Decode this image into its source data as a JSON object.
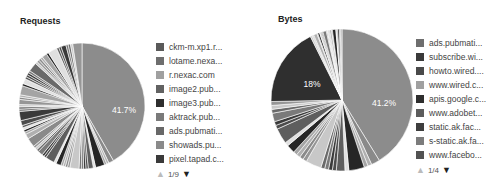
{
  "chart_data": [
    {
      "type": "pie",
      "title": "Requests",
      "legend_position": "right",
      "legend": [
        "ckm-m.xp1.r...",
        "lotame.nexa...",
        "r.nexac.com",
        "image2.pub...",
        "image3.pub...",
        "aktrack.pub...",
        "ads.pubmati...",
        "showads.pu...",
        "pixel.tapad.c..."
      ],
      "legend_colors": [
        "#5a5a5a",
        "#6e6e6e",
        "#a0a0a0",
        "#626262",
        "#2e2e2e",
        "#7a7a7a",
        "#686868",
        "#8a8a8a",
        "#3a3a3a"
      ],
      "slices": [
        {
          "label": "ckm-m.xp1.r...",
          "value": 41.7,
          "color": "#8c8c8c",
          "shown_label": "41.7%"
        },
        {
          "label": "other",
          "value": 58.3,
          "color": "#6a6a6a"
        }
      ],
      "pager": {
        "current": 1,
        "total": 9,
        "text": "1/9"
      }
    },
    {
      "type": "pie",
      "title": "Bytes",
      "legend_position": "right",
      "legend": [
        "ads.pubmati...",
        "subscribe.wi...",
        "howto.wired....",
        "www.wired.c...",
        "apis.google.c...",
        "www.adobet...",
        "static.ak.fac...",
        "s-static.ak.fa...",
        "www.facebo..."
      ],
      "legend_colors": [
        "#6e6e6e",
        "#3a3a3a",
        "#4a4a4a",
        "#a0a0a0",
        "#2e2e2e",
        "#5c5c5c",
        "#3e3e3e",
        "#7c7c7c",
        "#525252"
      ],
      "slices": [
        {
          "label": "ads.pubmati...",
          "value": 41.2,
          "color": "#8c8c8c",
          "shown_label": "41.2%"
        },
        {
          "label": "subscribe.wi...",
          "value": 18,
          "color": "#2f2f2f",
          "shown_label": "18%"
        },
        {
          "label": "other",
          "value": 40.8,
          "color": "#6a6a6a"
        }
      ],
      "pager": {
        "current": 1,
        "total": 4,
        "text": "1/4"
      }
    }
  ],
  "requests": {
    "title": "Requests",
    "big_label": "41.7%",
    "legend": [
      {
        "label": "ckm-m.xp1.r...",
        "color": "#5a5a5a"
      },
      {
        "label": "lotame.nexa...",
        "color": "#6e6e6e"
      },
      {
        "label": "r.nexac.com",
        "color": "#a0a0a0"
      },
      {
        "label": "image2.pub...",
        "color": "#626262"
      },
      {
        "label": "image3.pub...",
        "color": "#2e2e2e"
      },
      {
        "label": "aktrack.pub...",
        "color": "#7a7a7a"
      },
      {
        "label": "ads.pubmati...",
        "color": "#686868"
      },
      {
        "label": "showads.pu...",
        "color": "#8a8a8a"
      },
      {
        "label": "pixel.tapad.c...",
        "color": "#3a3a3a"
      }
    ],
    "pager": {
      "text": "1/9",
      "prev_icon": "▲",
      "next_icon": "▼"
    }
  },
  "bytes": {
    "title": "Bytes",
    "big_label": "41.2%",
    "second_label": "18%",
    "legend": [
      {
        "label": "ads.pubmati...",
        "color": "#6e6e6e"
      },
      {
        "label": "subscribe.wi...",
        "color": "#3a3a3a"
      },
      {
        "label": "howto.wired....",
        "color": "#4a4a4a"
      },
      {
        "label": "www.wired.c...",
        "color": "#a0a0a0"
      },
      {
        "label": "apis.google.c...",
        "color": "#2e2e2e"
      },
      {
        "label": "www.adobet...",
        "color": "#5c5c5c"
      },
      {
        "label": "static.ak.fac...",
        "color": "#3e3e3e"
      },
      {
        "label": "s-static.ak.fa...",
        "color": "#7c7c7c"
      },
      {
        "label": "www.facebo...",
        "color": "#525252"
      }
    ],
    "pager": {
      "text": "1/4",
      "prev_icon": "▲",
      "next_icon": "▼"
    }
  }
}
